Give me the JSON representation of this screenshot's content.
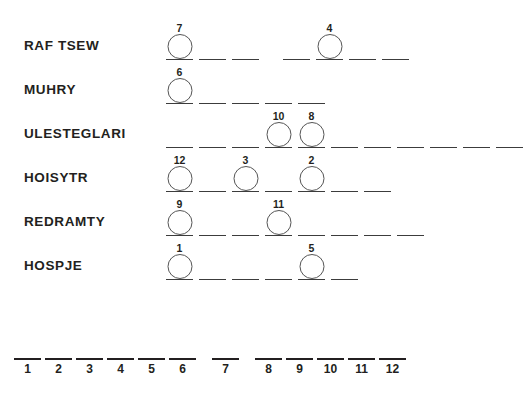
{
  "puzzle": {
    "background_color": "#ffffff",
    "ink_color": "#231f20",
    "rule_color": "#3c3c3c",
    "circle_color": "#555555",
    "rows": [
      {
        "clue": "RAF TSEW",
        "top": 22,
        "words": [
          {
            "left": 0,
            "slots": [
              {
                "circle": "7"
              },
              {
                "circle": ""
              },
              {
                "circle": ""
              }
            ]
          },
          {
            "left": 117,
            "slots": [
              {
                "circle": ""
              },
              {
                "circle": "4"
              },
              {
                "circle": ""
              },
              {
                "circle": ""
              }
            ]
          }
        ]
      },
      {
        "clue": "MUHRY",
        "top": 66,
        "words": [
          {
            "left": 0,
            "slots": [
              {
                "circle": "6"
              },
              {
                "circle": ""
              },
              {
                "circle": ""
              },
              {
                "circle": ""
              },
              {
                "circle": ""
              }
            ]
          }
        ]
      },
      {
        "clue": "ULESTEGLARI",
        "top": 110,
        "words": [
          {
            "left": 0,
            "slots": [
              {
                "circle": ""
              },
              {
                "circle": ""
              },
              {
                "circle": ""
              },
              {
                "circle": "10"
              },
              {
                "circle": "8"
              },
              {
                "circle": ""
              },
              {
                "circle": ""
              },
              {
                "circle": ""
              },
              {
                "circle": ""
              },
              {
                "circle": ""
              },
              {
                "circle": ""
              }
            ]
          }
        ]
      },
      {
        "clue": "HOISYTR",
        "top": 154,
        "words": [
          {
            "left": 0,
            "slots": [
              {
                "circle": "12"
              },
              {
                "circle": ""
              },
              {
                "circle": "3"
              },
              {
                "circle": ""
              },
              {
                "circle": "2"
              },
              {
                "circle": ""
              },
              {
                "circle": ""
              }
            ]
          }
        ]
      },
      {
        "clue": "REDRAMTY",
        "top": 198,
        "words": [
          {
            "left": 0,
            "slots": [
              {
                "circle": "9"
              },
              {
                "circle": ""
              },
              {
                "circle": ""
              },
              {
                "circle": "11"
              },
              {
                "circle": ""
              },
              {
                "circle": ""
              },
              {
                "circle": ""
              },
              {
                "circle": ""
              }
            ]
          }
        ]
      },
      {
        "clue": "HOSPJE",
        "top": 242,
        "words": [
          {
            "left": 0,
            "slots": [
              {
                "circle": "1"
              },
              {
                "circle": ""
              },
              {
                "circle": ""
              },
              {
                "circle": ""
              },
              {
                "circle": "5"
              },
              {
                "circle": ""
              }
            ]
          }
        ]
      }
    ],
    "solution": {
      "groups": [
        {
          "numbers": [
            "1",
            "2",
            "3",
            "4",
            "5",
            "6"
          ]
        },
        {
          "numbers": [
            "7"
          ]
        },
        {
          "numbers": [
            "8",
            "9",
            "10",
            "11",
            "12"
          ]
        }
      ]
    }
  }
}
